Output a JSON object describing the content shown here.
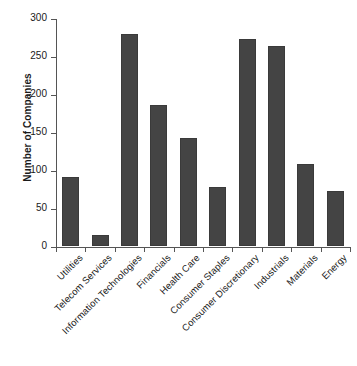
{
  "chart_data": {
    "type": "bar",
    "title": "",
    "xlabel": "",
    "ylabel": "Number of Companies",
    "ylim": [
      0,
      300
    ],
    "yticks": [
      0,
      50,
      100,
      150,
      200,
      250,
      300
    ],
    "grid": false,
    "legend": false,
    "bar_color": "#444444",
    "axis_color": "#555555",
    "categories": [
      "Utilities",
      "Telecom Services",
      "Information Technologies",
      "Financials",
      "Health Care",
      "Consumer Staples",
      "Consumer Discretionary",
      "Industrials",
      "Materials",
      "Energy"
    ],
    "values": [
      91,
      15,
      279,
      186,
      142,
      77,
      272,
      263,
      108,
      72
    ]
  }
}
